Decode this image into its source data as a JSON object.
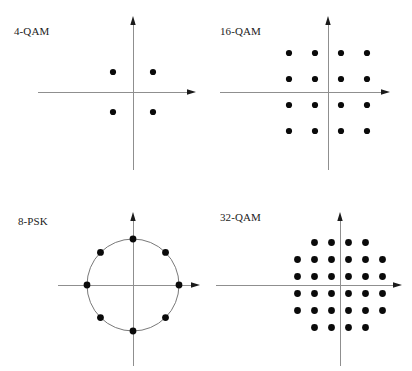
{
  "figure": {
    "background_color": "#ffffff",
    "dot_color": "#0a0a0a",
    "axis_color": "#8f8f8f",
    "circle_color": "#6a6a6a",
    "width": 412,
    "height": 371
  },
  "panels": [
    {
      "id": "4-qam",
      "label": "4-QAM",
      "label_x": 14,
      "label_y": 26,
      "origin_x": 133,
      "origin_y": 92,
      "x_axis_start": 38,
      "x_axis_end": 196,
      "y_axis_top": 16,
      "y_axis_bottom": 170,
      "has_circle": false,
      "dot_radius": 3.1,
      "spacing": 40,
      "points": [
        {
          "x": -1,
          "y": 1
        },
        {
          "x": 1,
          "y": 1
        },
        {
          "x": -1,
          "y": -1
        },
        {
          "x": 1,
          "y": -1
        }
      ]
    },
    {
      "id": "16-qam",
      "label": "16-QAM",
      "label_x": 14,
      "label_y": 26,
      "origin_x": 122,
      "origin_y": 92,
      "x_axis_start": 14,
      "x_axis_end": 184,
      "y_axis_top": 16,
      "y_axis_bottom": 170,
      "has_circle": false,
      "dot_radius": 3.1,
      "spacing": 26,
      "points": [
        {
          "x": -3,
          "y": 3
        },
        {
          "x": -1,
          "y": 3
        },
        {
          "x": 1,
          "y": 3
        },
        {
          "x": 3,
          "y": 3
        },
        {
          "x": -3,
          "y": 1
        },
        {
          "x": -1,
          "y": 1
        },
        {
          "x": 1,
          "y": 1
        },
        {
          "x": 3,
          "y": 1
        },
        {
          "x": -3,
          "y": -1
        },
        {
          "x": -1,
          "y": -1
        },
        {
          "x": 1,
          "y": -1
        },
        {
          "x": 3,
          "y": -1
        },
        {
          "x": -3,
          "y": -3
        },
        {
          "x": -1,
          "y": -3
        },
        {
          "x": 1,
          "y": -3
        },
        {
          "x": 3,
          "y": -3
        }
      ]
    },
    {
      "id": "8-psk",
      "label": "8-PSK",
      "label_x": 18,
      "label_y": 30,
      "origin_x": 133,
      "origin_y": 99,
      "x_axis_start": 58,
      "x_axis_end": 200,
      "y_axis_top": 26,
      "y_axis_bottom": 180,
      "has_circle": true,
      "circle_radius": 46,
      "dot_radius": 3.4,
      "angles_deg": [
        0,
        45,
        90,
        135,
        180,
        225,
        270,
        315
      ]
    },
    {
      "id": "32-qam",
      "label": "32-QAM",
      "label_x": 14,
      "label_y": 26,
      "origin_x": 134,
      "origin_y": 99,
      "x_axis_start": 10,
      "x_axis_end": 196,
      "y_axis_top": 26,
      "y_axis_bottom": 180,
      "has_circle": false,
      "dot_radius": 3.4,
      "spacing": 17,
      "points": [
        {
          "x": -3,
          "y": 5
        },
        {
          "x": -1,
          "y": 5
        },
        {
          "x": 1,
          "y": 5
        },
        {
          "x": 3,
          "y": 5
        },
        {
          "x": -5,
          "y": 3
        },
        {
          "x": -3,
          "y": 3
        },
        {
          "x": -1,
          "y": 3
        },
        {
          "x": 1,
          "y": 3
        },
        {
          "x": 3,
          "y": 3
        },
        {
          "x": 5,
          "y": 3
        },
        {
          "x": -5,
          "y": 1
        },
        {
          "x": -3,
          "y": 1
        },
        {
          "x": -1,
          "y": 1
        },
        {
          "x": 1,
          "y": 1
        },
        {
          "x": 3,
          "y": 1
        },
        {
          "x": 5,
          "y": 1
        },
        {
          "x": -5,
          "y": -1
        },
        {
          "x": -3,
          "y": -1
        },
        {
          "x": -1,
          "y": -1
        },
        {
          "x": 1,
          "y": -1
        },
        {
          "x": 3,
          "y": -1
        },
        {
          "x": 5,
          "y": -1
        },
        {
          "x": -5,
          "y": -3
        },
        {
          "x": -3,
          "y": -3
        },
        {
          "x": -1,
          "y": -3
        },
        {
          "x": 1,
          "y": -3
        },
        {
          "x": 3,
          "y": -3
        },
        {
          "x": 5,
          "y": -3
        },
        {
          "x": -3,
          "y": -5
        },
        {
          "x": -1,
          "y": -5
        },
        {
          "x": 1,
          "y": -5
        },
        {
          "x": 3,
          "y": -5
        }
      ]
    }
  ],
  "chart_data": {
    "type": "scatter",
    "xlabel": "",
    "ylabel": "",
    "grid": false,
    "legend": "none",
    "subplots": [
      {
        "title": "4-QAM",
        "type": "scatter",
        "point_count": 4,
        "x": [
          -1,
          1,
          -1,
          1
        ],
        "y": [
          1,
          1,
          -1,
          -1
        ]
      },
      {
        "title": "16-QAM",
        "type": "scatter",
        "point_count": 16,
        "x": [
          -3,
          -1,
          1,
          3,
          -3,
          -1,
          1,
          3,
          -3,
          -1,
          1,
          3,
          -3,
          -1,
          1,
          3
        ],
        "y": [
          3,
          3,
          3,
          3,
          1,
          1,
          1,
          1,
          -1,
          -1,
          -1,
          -1,
          -3,
          -3,
          -3,
          -3
        ]
      },
      {
        "title": "8-PSK",
        "type": "scatter",
        "point_count": 8,
        "radius": 1,
        "angles_deg": [
          0,
          45,
          90,
          135,
          180,
          225,
          270,
          315
        ],
        "annotation": "unit circle drawn through all 8 points"
      },
      {
        "title": "32-QAM",
        "type": "scatter",
        "point_count": 32,
        "rows": [
          {
            "y": 5,
            "x": [
              -3,
              -1,
              1,
              3
            ]
          },
          {
            "y": 3,
            "x": [
              -5,
              -3,
              -1,
              1,
              3,
              5
            ]
          },
          {
            "y": 1,
            "x": [
              -5,
              -3,
              -1,
              1,
              3,
              5
            ]
          },
          {
            "y": -1,
            "x": [
              -5,
              -3,
              -1,
              1,
              3,
              5
            ]
          },
          {
            "y": -3,
            "x": [
              -5,
              -3,
              -1,
              1,
              3,
              5
            ]
          },
          {
            "y": -5,
            "x": [
              -3,
              -1,
              1,
              3
            ]
          }
        ],
        "annotation": "cross-shaped constellation, 4/6/6/6/6/4"
      }
    ]
  }
}
